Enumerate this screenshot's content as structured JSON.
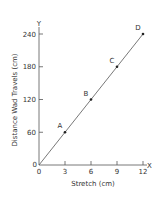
{
  "chart_data": {
    "type": "line",
    "title": "",
    "xlabel": "Stretch (cm)",
    "ylabel": "Distance Wad Travels (cm)",
    "x_axis_letter": "X",
    "y_axis_letter": "Y",
    "origin_label": "0",
    "xlim": [
      0,
      12
    ],
    "ylim": [
      0,
      240
    ],
    "x_ticks": [
      0,
      3,
      6,
      9,
      12
    ],
    "y_ticks": [
      60,
      120,
      180,
      240
    ],
    "grid": false,
    "legend": null,
    "series": [
      {
        "name": "Distance vs Stretch",
        "x": [
          0,
          3,
          6,
          9,
          12
        ],
        "y": [
          0,
          60,
          120,
          180,
          240
        ]
      }
    ],
    "points": [
      {
        "label": "A",
        "x": 3,
        "y": 60
      },
      {
        "label": "B",
        "x": 6,
        "y": 120
      },
      {
        "label": "C",
        "x": 9,
        "y": 180
      },
      {
        "label": "D",
        "x": 12,
        "y": 240
      }
    ],
    "colors": {
      "line": "#555555",
      "axis": "#555555",
      "point": "#222222"
    }
  }
}
